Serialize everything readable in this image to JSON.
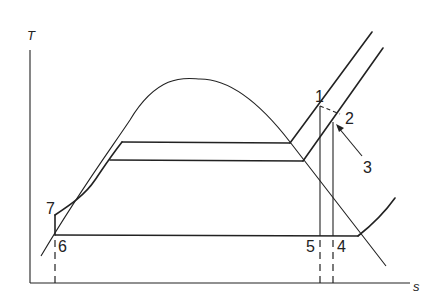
{
  "diagram": {
    "type": "T-s diagram",
    "axes": {
      "y_label": "T",
      "x_label": "s"
    },
    "points": [
      {
        "id": "1",
        "label": "1"
      },
      {
        "id": "2",
        "label": "2"
      },
      {
        "id": "3",
        "label": "3"
      },
      {
        "id": "4",
        "label": "4"
      },
      {
        "id": "5",
        "label": "5"
      },
      {
        "id": "6",
        "label": "6"
      },
      {
        "id": "7",
        "label": "7"
      }
    ],
    "line_color": "#222222",
    "background": "#ffffff"
  }
}
